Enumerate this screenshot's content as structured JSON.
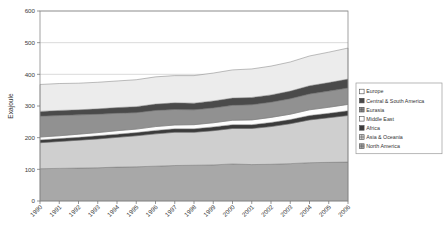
{
  "chart_data": {
    "type": "area",
    "stacked": true,
    "title": "",
    "xlabel": "",
    "ylabel": "Exajoule",
    "ylim": [
      0,
      600
    ],
    "ytick_step": 100,
    "yticks": [
      0,
      100,
      200,
      300,
      400,
      500,
      600
    ],
    "grid": true,
    "legend_position": "right",
    "categories": [
      "1990",
      "1991",
      "1992",
      "1993",
      "1994",
      "1995",
      "1996",
      "1997",
      "1998",
      "1999",
      "2000",
      "2001",
      "2002",
      "2003",
      "2004",
      "2005",
      "2006"
    ],
    "stack_order_bottom_to_top": [
      "North America",
      "Asia & Oceania",
      "Africa",
      "Middle East",
      "Eurasia",
      "Central & South America",
      "Europe"
    ],
    "series": [
      {
        "name": "North America",
        "color": "#a8a8a8",
        "swatch": "grid",
        "values": [
          102,
          103,
          104,
          105,
          107,
          108,
          110,
          112,
          113,
          114,
          117,
          115,
          116,
          118,
          121,
          122,
          123
        ]
      },
      {
        "name": "Asia & Oceania",
        "color": "#cfcfcf",
        "swatch": "grid",
        "values": [
          82,
          85,
          88,
          91,
          94,
          98,
          102,
          105,
          104,
          108,
          112,
          114,
          119,
          126,
          135,
          141,
          147
        ]
      },
      {
        "name": "Africa",
        "color": "#3b3b3b",
        "swatch": "solid",
        "values": [
          9,
          9,
          9,
          10,
          10,
          10,
          11,
          11,
          11,
          12,
          12,
          12,
          13,
          13,
          14,
          14,
          15
        ]
      },
      {
        "name": "Middle East",
        "color": "#fdfdfd",
        "swatch": "hollow",
        "values": [
          9,
          9,
          10,
          10,
          11,
          11,
          12,
          12,
          13,
          13,
          14,
          15,
          16,
          17,
          18,
          19,
          20
        ]
      },
      {
        "name": "Eurasia",
        "color": "#919191",
        "swatch": "grid",
        "values": [
          66,
          64,
          61,
          58,
          55,
          52,
          51,
          49,
          47,
          47,
          47,
          48,
          48,
          49,
          50,
          51,
          52
        ]
      },
      {
        "name": "Central & South America",
        "color": "#4a4a4a",
        "swatch": "solid",
        "values": [
          15,
          16,
          16,
          17,
          18,
          19,
          20,
          21,
          21,
          22,
          23,
          23,
          23,
          24,
          26,
          27,
          28
        ]
      },
      {
        "name": "Europe",
        "color": "#ececec",
        "swatch": "hollow",
        "values": [
          85,
          85,
          84,
          84,
          84,
          85,
          86,
          86,
          87,
          88,
          89,
          90,
          91,
          92,
          94,
          96,
          98
        ]
      }
    ]
  },
  "legend": {
    "items": [
      {
        "label": "Europe",
        "swatch": "hollow"
      },
      {
        "label": "Central & South America",
        "swatch": "solid"
      },
      {
        "label": "Eurasia",
        "swatch": "grid"
      },
      {
        "label": "Middle East",
        "swatch": "hollow"
      },
      {
        "label": "Africa",
        "swatch": "solid"
      },
      {
        "label": "Asia & Oceania",
        "swatch": "grid"
      },
      {
        "label": "North America",
        "swatch": "grid"
      }
    ]
  }
}
